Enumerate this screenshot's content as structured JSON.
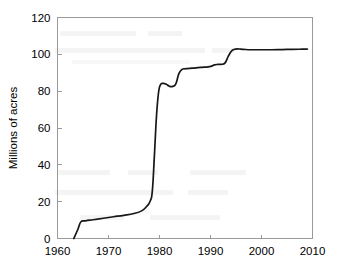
{
  "chart_data": {
    "type": "line",
    "title": "",
    "xlabel": "",
    "ylabel": "Millions of acres",
    "xlim": [
      1960,
      2010
    ],
    "ylim": [
      0,
      120
    ],
    "grid": false,
    "legend": "none",
    "xticks": [
      1960,
      1970,
      1980,
      1990,
      2000,
      2010
    ],
    "yticks": [
      0,
      20,
      40,
      60,
      80,
      100,
      120
    ],
    "series": [
      {
        "name": "Wilderness acreage",
        "color": "#171717",
        "x": [
          1963.2,
          1964.0,
          1964.6,
          1965.5,
          1967.0,
          1969.0,
          1971.0,
          1973.0,
          1975.0,
          1976.5,
          1977.5,
          1978.2,
          1978.6,
          1979.0,
          1979.4,
          1979.8,
          1980.2,
          1980.7,
          1981.3,
          1982.0,
          1982.6,
          1983.2,
          1983.8,
          1984.4,
          1985.2,
          1986.5,
          1988.0,
          1989.5,
          1990.2,
          1990.8,
          1991.5,
          1992.3,
          1992.9,
          1993.5,
          1994.2,
          1994.9,
          1995.6,
          1996.5,
          1998.0,
          2000.0,
          2002.0,
          2004.0,
          2006.0,
          2008.0,
          2009.0
        ],
        "y": [
          0.0,
          5.0,
          9.1,
          9.6,
          10.2,
          11.0,
          11.8,
          12.6,
          13.6,
          15.0,
          17.5,
          20.5,
          26.0,
          45.0,
          66.0,
          79.0,
          83.5,
          84.2,
          83.8,
          82.6,
          82.6,
          84.0,
          89.5,
          91.8,
          92.2,
          92.5,
          92.9,
          93.2,
          93.6,
          94.3,
          94.5,
          94.6,
          95.5,
          99.0,
          102.0,
          102.8,
          102.9,
          102.7,
          102.5,
          102.5,
          102.5,
          102.6,
          102.7,
          102.8,
          102.9
        ]
      }
    ]
  },
  "axes": {
    "y_title": "Millions of acres",
    "y_tick_labels": [
      "120",
      "100",
      "80",
      "60",
      "40",
      "20",
      "0"
    ],
    "x_tick_labels": [
      "1960",
      "1970",
      "1980",
      "1990",
      "2000",
      "2010"
    ]
  },
  "colors": {
    "line": "#171717",
    "frame": "#9a9a9a",
    "background": "#ffffff",
    "text": "#000000"
  }
}
